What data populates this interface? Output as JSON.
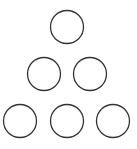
{
  "diagram": {
    "stroke_color": "#333333",
    "fill_color": "#ffffff",
    "circles": [
      {
        "row": 1,
        "cx": 67,
        "cy": 27,
        "r": 16.5
      },
      {
        "row": 2,
        "cx": 44,
        "cy": 74,
        "r": 16.5
      },
      {
        "row": 2,
        "cx": 90,
        "cy": 74,
        "r": 16.5
      },
      {
        "row": 3,
        "cx": 20,
        "cy": 121,
        "r": 16.5
      },
      {
        "row": 3,
        "cx": 67,
        "cy": 121,
        "r": 16.5
      },
      {
        "row": 3,
        "cx": 113,
        "cy": 121,
        "r": 16.5
      }
    ]
  }
}
